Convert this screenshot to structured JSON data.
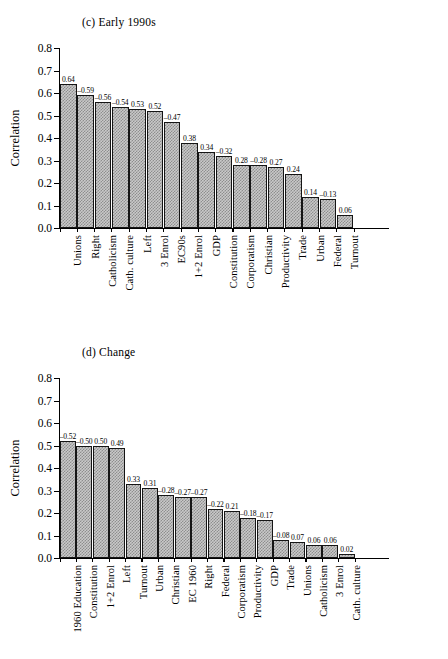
{
  "figure": {
    "panels": [
      {
        "id": "panel-c",
        "title": "(c) Early 1990s",
        "ylabel": "Correlation",
        "yticks": [
          "0.0",
          "0.1",
          "0.2",
          "0.3",
          "0.4",
          "0.5",
          "0.6",
          "0.7",
          "0.8"
        ]
      },
      {
        "id": "panel-d",
        "title": "(d) Change",
        "ylabel": "Correlation",
        "yticks": [
          "0.0",
          "0.1",
          "0.2",
          "0.3",
          "0.4",
          "0.5",
          "0.6",
          "0.7",
          "0.8"
        ]
      }
    ]
  },
  "chart_data": [
    {
      "type": "bar",
      "title": "(c) Early 1990s",
      "xlabel": "",
      "ylabel": "Correlation",
      "ylim": [
        0.0,
        0.8
      ],
      "grid": false,
      "legend": null,
      "categories": [
        "Unions",
        "Right",
        "Catholicism",
        "Cath. culture",
        "Left",
        "3 Enrol",
        "EC90s",
        "1+2 Enrol",
        "GDP",
        "Constitution",
        "Corporatism",
        "Christian",
        "Productivity",
        "Trade",
        "Urban",
        "Federal",
        "Turnout"
      ],
      "values": [
        0.64,
        0.59,
        0.56,
        0.54,
        0.53,
        0.52,
        0.47,
        0.38,
        0.34,
        0.32,
        0.28,
        0.28,
        0.27,
        0.24,
        0.14,
        0.13,
        0.06
      ],
      "data_labels": [
        "0.64",
        "–0.59",
        "–0.56",
        "–0.54",
        "0.53",
        "0.52",
        "–0.47",
        "0.38",
        "0.34",
        "–0.32",
        "0.28",
        "–0.28",
        "0.27",
        "0.24",
        "0.14",
        "–0.13",
        "0.06"
      ]
    },
    {
      "type": "bar",
      "title": "(d) Change",
      "xlabel": "",
      "ylabel": "Correlation",
      "ylim": [
        0.0,
        0.8
      ],
      "grid": false,
      "legend": null,
      "categories": [
        "1960 Education",
        "Constitution",
        "1+2 Enrol",
        "Left",
        "Turnout",
        "Urban",
        "Christian",
        "EC 1960",
        "Right",
        "Federal",
        "Corporatism",
        "Productivity",
        "GDP",
        "Trade",
        "Unions",
        "Catholicism",
        "3 Enrol",
        "Cath. culture"
      ],
      "values": [
        0.52,
        0.5,
        0.5,
        0.49,
        0.33,
        0.31,
        0.28,
        0.27,
        0.27,
        0.22,
        0.21,
        0.18,
        0.17,
        0.08,
        0.07,
        0.06,
        0.06,
        0.02
      ],
      "data_labels": [
        "–0.52",
        "–0.50",
        "0.50",
        "0.49",
        "0.33",
        "0.31",
        "–0.28",
        "–0.27",
        "–0.27",
        "–0.22",
        "0.21",
        "–0.18",
        "–0.17",
        "–0.08",
        "0.07",
        "0.06",
        "0.06",
        "0.02"
      ]
    }
  ]
}
